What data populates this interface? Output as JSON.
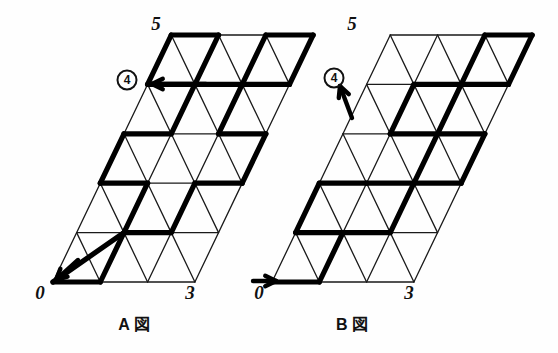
{
  "page": {
    "background": "#fefefe",
    "ink": "#111111",
    "width": 558,
    "height": 353
  },
  "style": {
    "thin_stroke": "#1a1a1a",
    "thick_stroke": "#000000",
    "thin_width": 1.3,
    "thick_width": 5.2
  },
  "grid": {
    "cols": 3,
    "rows": 5,
    "cell_w": 47.3,
    "cell_h": 49.4,
    "skew": 23.65
  },
  "figures": [
    {
      "id": "A",
      "caption": "A 図",
      "caption_x": 134,
      "caption_y": 330,
      "origin_x": 53,
      "origin_y": 282,
      "labels": {
        "origin": "0",
        "origin_x": 40,
        "origin_y": 299,
        "right": "3",
        "right_x": 190,
        "right_y": 299,
        "top": "5",
        "top_x": 156,
        "top_y": 30
      },
      "marker": {
        "text": "4",
        "cx": 127,
        "cy": 80,
        "r": 9.5
      },
      "arrow_in": {
        "x1": 78,
        "y1": 260,
        "x2": 56,
        "y2": 280
      },
      "arrow_out": {
        "x1": 206,
        "y1": 84,
        "x2": 152,
        "y2": 84
      },
      "thick_path": [
        [
          0,
          0
        ],
        [
          1,
          1
        ],
        [
          1,
          2
        ],
        [
          0,
          2
        ],
        [
          0,
          3
        ],
        [
          1,
          3
        ],
        [
          1,
          4
        ],
        [
          0,
          4
        ],
        [
          0,
          5
        ],
        [
          1,
          5
        ],
        [
          1,
          4
        ],
        [
          2,
          4
        ],
        [
          2,
          5
        ],
        [
          3,
          5
        ],
        [
          3,
          4
        ],
        [
          2,
          4
        ],
        [
          2,
          3
        ],
        [
          3,
          3
        ],
        [
          3,
          2
        ],
        [
          2,
          2
        ],
        [
          2,
          1
        ],
        [
          1,
          1
        ],
        [
          1,
          0
        ],
        [
          0,
          0
        ]
      ]
    },
    {
      "id": "B",
      "caption": "B 図",
      "caption_x": 352,
      "caption_y": 330,
      "origin_x": 272,
      "origin_y": 282,
      "labels": {
        "origin": "0",
        "origin_x": 259,
        "origin_y": 299,
        "right": "3",
        "right_x": 409,
        "right_y": 299,
        "top": "5",
        "top_x": 352,
        "top_y": 30
      },
      "marker": {
        "text": "4",
        "cx": 334,
        "cy": 78,
        "r": 9.5
      },
      "arrow_in": {
        "x1": 253,
        "y1": 281,
        "x2": 276,
        "y2": 281
      },
      "arrow_out": {
        "x1": 352,
        "y1": 118,
        "x2": 340,
        "y2": 86
      },
      "thick_path": [
        [
          0,
          0
        ],
        [
          1,
          0
        ],
        [
          1,
          1
        ],
        [
          0,
          1
        ],
        [
          0,
          2
        ],
        [
          1,
          2
        ],
        [
          2,
          2
        ],
        [
          2,
          3
        ],
        [
          1,
          3
        ],
        [
          1,
          4
        ],
        [
          2,
          4
        ],
        [
          2,
          5
        ],
        [
          3,
          5
        ],
        [
          3,
          4
        ],
        [
          2,
          4
        ],
        [
          2,
          3
        ],
        [
          3,
          3
        ],
        [
          3,
          2
        ],
        [
          2,
          2
        ],
        [
          2,
          1
        ],
        [
          1,
          1
        ]
      ]
    }
  ]
}
